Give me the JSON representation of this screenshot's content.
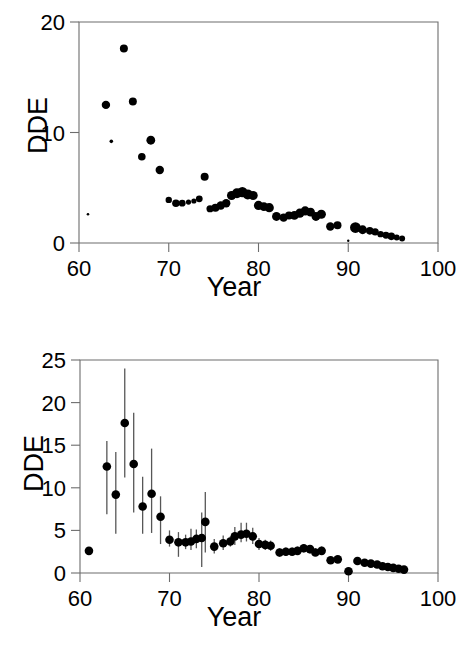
{
  "figure": {
    "background_color": "#ffffff",
    "point_color": "#000000",
    "errorbar_color": "#575757",
    "axis_color": "#6d6d6d"
  },
  "panels": [
    {
      "id": "top",
      "ylabel": "DDE",
      "xlabel": "Year",
      "y_ticks": [
        "0",
        "10",
        "20"
      ],
      "x_ticks": [
        "60",
        "70",
        "80",
        "90",
        "100"
      ]
    },
    {
      "id": "bottom",
      "ylabel": "DDE",
      "xlabel": "Year",
      "y_ticks": [
        "0",
        "5",
        "10",
        "15",
        "20",
        "25"
      ],
      "x_ticks": [
        "60",
        "70",
        "80",
        "90",
        "100"
      ]
    }
  ],
  "chart_data": [
    {
      "type": "scatter",
      "panel": "top",
      "title": "",
      "subtitle": "",
      "xlabel": "Year",
      "ylabel": "DDE",
      "xlim": [
        60,
        100
      ],
      "ylim": [
        0,
        20
      ],
      "x_ticks": [
        60,
        70,
        80,
        90,
        100
      ],
      "y_ticks": [
        0,
        10,
        20
      ],
      "grid": false,
      "legend": null,
      "marker_size_encodes": "sample-size",
      "annotations": [],
      "points": [
        {
          "x": 61,
          "y": 2.6,
          "size": 1.3
        },
        {
          "x": 63,
          "y": 12.5,
          "size": 4.2
        },
        {
          "x": 63.6,
          "y": 9.2,
          "size": 1.8
        },
        {
          "x": 65,
          "y": 17.6,
          "size": 4.0
        },
        {
          "x": 66,
          "y": 12.8,
          "size": 4.0
        },
        {
          "x": 67,
          "y": 7.8,
          "size": 3.8
        },
        {
          "x": 68,
          "y": 9.3,
          "size": 4.4
        },
        {
          "x": 69,
          "y": 6.6,
          "size": 4.2
        },
        {
          "x": 70,
          "y": 3.9,
          "size": 3.2
        },
        {
          "x": 70.8,
          "y": 3.6,
          "size": 3.8
        },
        {
          "x": 71.5,
          "y": 3.6,
          "size": 3.4
        },
        {
          "x": 72.2,
          "y": 3.7,
          "size": 2.6
        },
        {
          "x": 72.8,
          "y": 3.8,
          "size": 2.6
        },
        {
          "x": 73.4,
          "y": 4.0,
          "size": 3.4
        },
        {
          "x": 74,
          "y": 6.0,
          "size": 4.0
        },
        {
          "x": 74.6,
          "y": 3.1,
          "size": 3.6
        },
        {
          "x": 75.2,
          "y": 3.2,
          "size": 4.0
        },
        {
          "x": 75.8,
          "y": 3.4,
          "size": 4.2
        },
        {
          "x": 76.4,
          "y": 3.6,
          "size": 4.2
        },
        {
          "x": 77,
          "y": 4.3,
          "size": 4.6
        },
        {
          "x": 77.6,
          "y": 4.5,
          "size": 5.0
        },
        {
          "x": 78.2,
          "y": 4.6,
          "size": 5.2
        },
        {
          "x": 78.8,
          "y": 4.4,
          "size": 5.0
        },
        {
          "x": 79.4,
          "y": 4.3,
          "size": 4.6
        },
        {
          "x": 80,
          "y": 3.4,
          "size": 4.6
        },
        {
          "x": 80.6,
          "y": 3.3,
          "size": 4.4
        },
        {
          "x": 81.2,
          "y": 3.2,
          "size": 4.6
        },
        {
          "x": 82,
          "y": 2.4,
          "size": 4.4
        },
        {
          "x": 82.8,
          "y": 2.3,
          "size": 4.2
        },
        {
          "x": 83.4,
          "y": 2.5,
          "size": 4.0
        },
        {
          "x": 84,
          "y": 2.5,
          "size": 4.4
        },
        {
          "x": 84.6,
          "y": 2.7,
          "size": 4.6
        },
        {
          "x": 85.2,
          "y": 2.9,
          "size": 4.6
        },
        {
          "x": 85.8,
          "y": 2.8,
          "size": 4.4
        },
        {
          "x": 86.4,
          "y": 2.4,
          "size": 4.4
        },
        {
          "x": 87,
          "y": 2.6,
          "size": 4.6
        },
        {
          "x": 88,
          "y": 1.5,
          "size": 4.2
        },
        {
          "x": 88.8,
          "y": 1.6,
          "size": 4.0
        },
        {
          "x": 90,
          "y": 0.2,
          "size": 1.2
        },
        {
          "x": 90.8,
          "y": 1.4,
          "size": 5.4
        },
        {
          "x": 91.6,
          "y": 1.2,
          "size": 4.4
        },
        {
          "x": 92.4,
          "y": 1.1,
          "size": 3.8
        },
        {
          "x": 93,
          "y": 1.0,
          "size": 3.6
        },
        {
          "x": 93.6,
          "y": 0.8,
          "size": 3.2
        },
        {
          "x": 94.2,
          "y": 0.7,
          "size": 3.4
        },
        {
          "x": 94.8,
          "y": 0.6,
          "size": 3.8
        },
        {
          "x": 95.4,
          "y": 0.5,
          "size": 3.0
        },
        {
          "x": 96,
          "y": 0.4,
          "size": 3.0
        }
      ]
    },
    {
      "type": "scatter",
      "panel": "bottom",
      "title": "",
      "subtitle": "",
      "xlabel": "Year",
      "ylabel": "DDE",
      "xlim": [
        60,
        100
      ],
      "ylim": [
        0,
        25
      ],
      "x_ticks": [
        60,
        70,
        80,
        90,
        100
      ],
      "y_ticks": [
        0,
        5,
        10,
        15,
        20,
        25
      ],
      "grid": false,
      "legend": null,
      "errorbars": true,
      "annotations": [],
      "points": [
        {
          "x": 61,
          "y": 2.6,
          "lo": 2.6,
          "hi": 2.6
        },
        {
          "x": 63,
          "y": 12.5,
          "lo": 6.9,
          "hi": 15.5
        },
        {
          "x": 64,
          "y": 9.2,
          "lo": 4.6,
          "hi": 14.2
        },
        {
          "x": 65,
          "y": 17.6,
          "lo": 11.2,
          "hi": 24.0
        },
        {
          "x": 66,
          "y": 12.8,
          "lo": 7.1,
          "hi": 18.8
        },
        {
          "x": 67,
          "y": 7.8,
          "lo": 4.6,
          "hi": 11.3
        },
        {
          "x": 68,
          "y": 9.3,
          "lo": 4.7,
          "hi": 14.6
        },
        {
          "x": 69,
          "y": 6.6,
          "lo": 3.4,
          "hi": 9.0
        },
        {
          "x": 70,
          "y": 3.9,
          "lo": 3.1,
          "hi": 5.0
        },
        {
          "x": 71,
          "y": 3.6,
          "lo": 1.9,
          "hi": 4.8
        },
        {
          "x": 71.8,
          "y": 3.6,
          "lo": 2.8,
          "hi": 4.5
        },
        {
          "x": 72.4,
          "y": 3.7,
          "lo": 2.7,
          "hi": 5.2
        },
        {
          "x": 73,
          "y": 4.0,
          "lo": 2.9,
          "hi": 5.1
        },
        {
          "x": 73.6,
          "y": 4.1,
          "lo": 0.7,
          "hi": 7.1
        },
        {
          "x": 74,
          "y": 6.0,
          "lo": 2.4,
          "hi": 9.5
        },
        {
          "x": 75,
          "y": 3.1,
          "lo": 2.3,
          "hi": 4.0
        },
        {
          "x": 76,
          "y": 3.5,
          "lo": 2.7,
          "hi": 4.4
        },
        {
          "x": 76.8,
          "y": 3.7,
          "lo": 3.1,
          "hi": 4.3
        },
        {
          "x": 77.3,
          "y": 4.3,
          "lo": 3.3,
          "hi": 5.4
        },
        {
          "x": 78,
          "y": 4.5,
          "lo": 3.6,
          "hi": 5.9
        },
        {
          "x": 78.6,
          "y": 4.6,
          "lo": 3.7,
          "hi": 5.9
        },
        {
          "x": 79.3,
          "y": 4.3,
          "lo": 3.4,
          "hi": 5.3
        },
        {
          "x": 80,
          "y": 3.4,
          "lo": 2.7,
          "hi": 4.1
        },
        {
          "x": 80.7,
          "y": 3.3,
          "lo": 2.7,
          "hi": 3.9
        },
        {
          "x": 81.3,
          "y": 3.2,
          "lo": 2.6,
          "hi": 3.8
        },
        {
          "x": 82.3,
          "y": 2.4,
          "lo": 1.9,
          "hi": 2.9
        },
        {
          "x": 83,
          "y": 2.5,
          "lo": 2.0,
          "hi": 3.0
        },
        {
          "x": 83.7,
          "y": 2.5,
          "lo": 2.1,
          "hi": 3.0
        },
        {
          "x": 84.3,
          "y": 2.6,
          "lo": 2.2,
          "hi": 3.1
        },
        {
          "x": 85,
          "y": 2.9,
          "lo": 2.4,
          "hi": 3.4
        },
        {
          "x": 85.7,
          "y": 2.8,
          "lo": 2.3,
          "hi": 3.3
        },
        {
          "x": 86.3,
          "y": 2.4,
          "lo": 2.0,
          "hi": 2.9
        },
        {
          "x": 87,
          "y": 2.6,
          "lo": 2.2,
          "hi": 3.1
        },
        {
          "x": 88,
          "y": 1.5,
          "lo": 1.2,
          "hi": 1.9
        },
        {
          "x": 88.8,
          "y": 1.6,
          "lo": 1.2,
          "hi": 2.0
        },
        {
          "x": 90,
          "y": 0.2,
          "lo": 0.1,
          "hi": 0.4
        },
        {
          "x": 91,
          "y": 1.4,
          "lo": 1.1,
          "hi": 1.7
        },
        {
          "x": 91.8,
          "y": 1.2,
          "lo": 0.9,
          "hi": 1.5
        },
        {
          "x": 92.5,
          "y": 1.1,
          "lo": 0.8,
          "hi": 1.4
        },
        {
          "x": 93.2,
          "y": 1.0,
          "lo": 0.7,
          "hi": 1.3
        },
        {
          "x": 93.8,
          "y": 0.8,
          "lo": 0.6,
          "hi": 1.1
        },
        {
          "x": 94.4,
          "y": 0.7,
          "lo": 0.5,
          "hi": 1.0
        },
        {
          "x": 95,
          "y": 0.6,
          "lo": 0.4,
          "hi": 0.9
        },
        {
          "x": 95.6,
          "y": 0.5,
          "lo": 0.3,
          "hi": 0.8
        },
        {
          "x": 96.2,
          "y": 0.4,
          "lo": 0.2,
          "hi": 0.7
        }
      ]
    }
  ]
}
